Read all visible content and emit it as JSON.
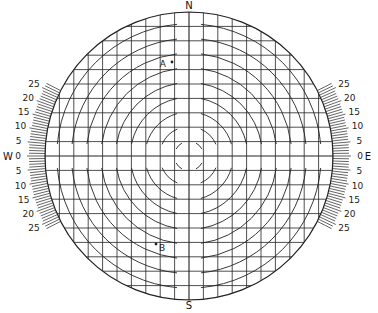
{
  "diagram": {
    "type": "sun-angle / sky chart grid",
    "cardinals": {
      "north": "N",
      "south": "S",
      "east": "E",
      "west": "W"
    },
    "points": [
      {
        "label": "A",
        "position": "upper, north of center"
      },
      {
        "label": "B",
        "position": "lower left, south-west of center"
      }
    ],
    "scale_labels": [
      "25",
      "20",
      "15",
      "10",
      "5",
      "0",
      "5",
      "10",
      "15",
      "20",
      "25"
    ],
    "colors": {
      "ink": "#222222",
      "background": "#ffffff"
    }
  }
}
